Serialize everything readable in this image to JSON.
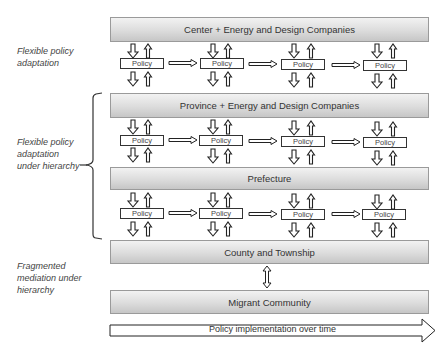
{
  "levels": [
    {
      "label": "Center + Energy and Design Companies"
    },
    {
      "label": "Province + Energy and Design Companies"
    },
    {
      "label": "Prefecture"
    },
    {
      "label": "County and Township"
    },
    {
      "label": "Migrant Community"
    }
  ],
  "policy_rows": [
    {
      "boxes": [
        "Policy",
        "Policy",
        "Policy",
        "Policy"
      ]
    },
    {
      "boxes": [
        "Policy",
        "Policy",
        "Policy",
        "Policy"
      ]
    },
    {
      "boxes": [
        "Policy",
        "Policy",
        "Policy",
        "Policy"
      ]
    }
  ],
  "side_labels": {
    "flexible": [
      "Flexible policy",
      "adaptation"
    ],
    "hierarchy": [
      "Flexible policy",
      "adaptation",
      "under hierarchy"
    ],
    "fragmented": [
      "Fragmented",
      "mediation under",
      "hierarchy"
    ]
  },
  "timeline": {
    "label": "Policy implementation over time"
  }
}
